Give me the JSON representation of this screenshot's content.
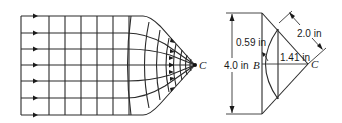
{
  "figure": {
    "left_panel": {
      "description": "Flow net: uniform parallel flow lines converging to point C",
      "point_label": "C",
      "flow_lines": 7,
      "equipotential_lines_straight": 7
    },
    "right_panel": {
      "description": "Geometry sketch of converging section",
      "labels": {
        "height": "4.0 in",
        "point_b": "B",
        "point_c": "C",
        "offset": "0.59 in",
        "chord_distance": "1.41 in",
        "radius": "2.0 in"
      }
    }
  }
}
